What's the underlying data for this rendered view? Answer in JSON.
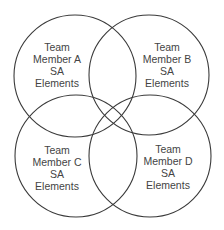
{
  "diagram": {
    "type": "venn",
    "stroke_color": "#3a3a3a",
    "text_color": "#444444",
    "sets": [
      {
        "id": "A",
        "lines": [
          "Team",
          "Member A",
          "SA",
          "Elements"
        ],
        "cx": 75,
        "cy": 76,
        "r": 61
      },
      {
        "id": "B",
        "lines": [
          "Team",
          "Member B",
          "SA",
          "Elements"
        ],
        "cx": 149,
        "cy": 75,
        "r": 60
      },
      {
        "id": "C",
        "lines": [
          "Team",
          "Member C",
          "SA",
          "Elements"
        ],
        "cx": 76,
        "cy": 156,
        "r": 61
      },
      {
        "id": "D",
        "lines": [
          "Team",
          "Member D",
          "SA",
          "Elements"
        ],
        "cx": 150,
        "cy": 156,
        "r": 61
      }
    ]
  }
}
